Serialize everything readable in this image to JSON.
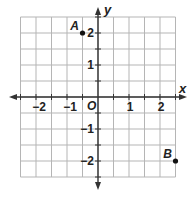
{
  "diagram": {
    "type": "coordinate-plane",
    "x_axis_label": "x",
    "y_axis_label": "y",
    "origin_label": "O",
    "x_range": [
      -2.5,
      2.5
    ],
    "y_range": [
      -2.5,
      2.5
    ],
    "grid_step": 0.5,
    "x_tick_labels": [
      {
        "value": -2,
        "text": "−2"
      },
      {
        "value": -1,
        "text": "−1"
      },
      {
        "value": 1,
        "text": "1"
      },
      {
        "value": 2,
        "text": "2"
      }
    ],
    "y_tick_labels": [
      {
        "value": 2,
        "text": "2"
      },
      {
        "value": 1,
        "text": "1"
      },
      {
        "value": -1,
        "text": "−1"
      },
      {
        "value": -2,
        "text": "−2"
      }
    ],
    "points": [
      {
        "name": "A",
        "x": -0.5,
        "y": 2
      },
      {
        "name": "B",
        "x": 2.5,
        "y": -2
      }
    ],
    "colors": {
      "grid": "#b5b5b5",
      "axis": "#333333",
      "point": "#111111",
      "text": "#222222"
    }
  }
}
